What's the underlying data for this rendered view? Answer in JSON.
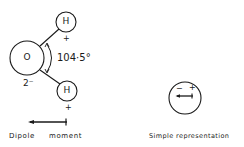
{
  "water_molecule": {
    "oxygen": {
      "symbol": "O",
      "charge": "2⁻"
    },
    "hydrogen_top": {
      "symbol": "H",
      "charge": "+"
    },
    "hydrogen_bottom": {
      "symbol": "H",
      "charge": "+"
    },
    "bond_angle": "104·5°"
  },
  "dipole": {
    "label_word1": "Dipole",
    "label_word2": "moment"
  },
  "simple": {
    "minus": "−",
    "plus": "+",
    "label": "Simple representation"
  },
  "colors": {
    "ink": "#1a1a1a",
    "background": "#ffffff"
  }
}
